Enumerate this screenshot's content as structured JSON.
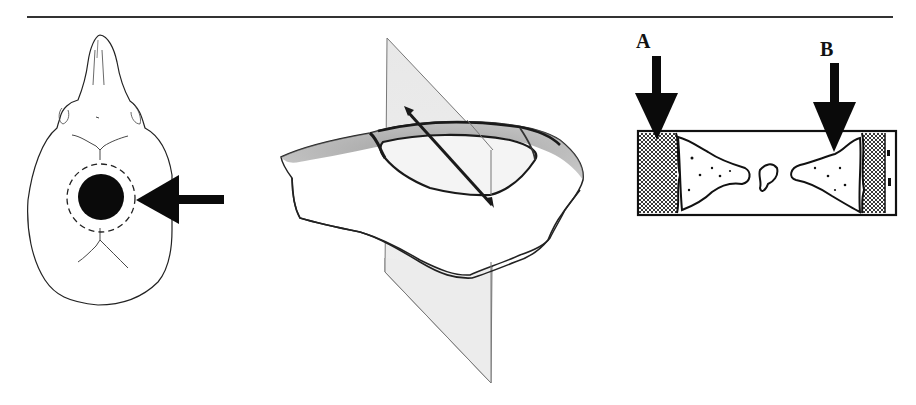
{
  "figure": {
    "type": "scientific-illustration",
    "panels": [
      {
        "id": "skull",
        "description": "Dorsal view of skull with circular craniotomy site marked by a filled black circle inside a dashed circle, indicated by a left-pointing arrow",
        "icons": [
          "skull-outline",
          "craniotomy-circle",
          "dashed-circle",
          "arrow-left-icon"
        ]
      },
      {
        "id": "bone-section",
        "description": "Three-dimensional sketch of removed bone disc with a vertical shaded cutting plane and a diagonal section arrow",
        "icons": [
          "bone-disc",
          "cutting-plane",
          "section-arrow-icon"
        ]
      },
      {
        "id": "cross-section",
        "description": "Rectangular cross-section of bone defect with stippled regenerating bone at both margins and two downward arrows",
        "labels": {
          "a": "A",
          "b": "B"
        },
        "icons": [
          "arrow-down-icon",
          "arrow-down-icon"
        ]
      }
    ],
    "colors": {
      "ink": "#111111",
      "rule": "#333333",
      "plane_fill": "#e6e6e6",
      "plane_edge": "#777777",
      "background": "#ffffff"
    }
  }
}
